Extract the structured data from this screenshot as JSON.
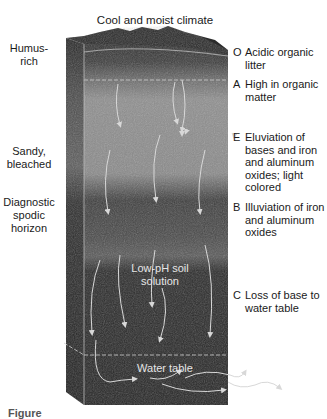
{
  "figure": {
    "title": "Cool and moist climate",
    "left_labels": [
      {
        "text": "Humus-\nrich"
      },
      {
        "text": "Sandy,\nbleached"
      },
      {
        "text": "Diagnostic\nspodic\nhorizon"
      }
    ],
    "horizons": [
      {
        "letter": "O",
        "description": "Acidic organic litter"
      },
      {
        "letter": "A",
        "description": "High in organic matter"
      },
      {
        "letter": "E",
        "description": "Eluviation of bases and iron and aluminum oxides; light colored"
      },
      {
        "letter": "B",
        "description": "Illuviation of iron and aluminum oxides"
      },
      {
        "letter": "C",
        "description": "Loss of base to water table"
      }
    ],
    "inner_labels": {
      "solution": "Low-pH soil solution",
      "water_table": "Water table"
    },
    "caption_fragment": "Figure"
  },
  "colors": {
    "o_horizon": "#3a3a3a",
    "a_horizon": "#4a4a4a",
    "e_horizon": "#8e8e8e",
    "b_horizon": "#3c3c3c",
    "c_horizon": "#2a2a2a",
    "side_face": "#2f2f2f",
    "arrows": "#d8d8d8"
  }
}
